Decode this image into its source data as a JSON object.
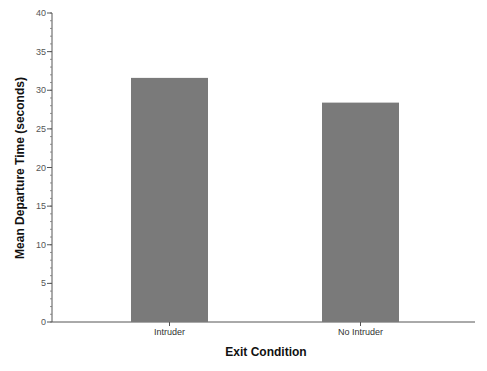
{
  "chart_data": {
    "type": "bar",
    "title": "",
    "xlabel": "Exit Condition",
    "ylabel": "Mean Departure Time (seconds)",
    "categories": [
      "Intruder",
      "No Intruder"
    ],
    "values": [
      31.6,
      28.4
    ],
    "ylim": [
      0,
      40
    ],
    "yticks": [
      0,
      5,
      10,
      15,
      20,
      25,
      30,
      35,
      40
    ],
    "ytick_labels": [
      "0",
      "5",
      "10",
      "15",
      "20",
      "25",
      "30",
      "35",
      "40"
    ],
    "minor_ticks_per_major": 5,
    "grid": false,
    "legend": null,
    "bar_color": "#7a7a7a"
  }
}
